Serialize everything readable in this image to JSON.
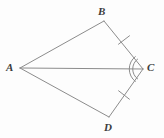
{
  "figure": {
    "name": "kite-quadrilateral-ABCD-with-diagonal-AC",
    "type": "geometry-diagram",
    "background_color": "#fdfdfd",
    "stroke_color": "#8c8c8c",
    "label_color": "#3c3c3c",
    "width": 164,
    "height": 138
  },
  "vertices": [
    {
      "id": "A",
      "label": "A",
      "x": 20,
      "y": 68
    },
    {
      "id": "B",
      "label": "B",
      "x": 104,
      "y": 21
    },
    {
      "id": "C",
      "label": "C",
      "x": 143,
      "y": 69
    },
    {
      "id": "D",
      "label": "D",
      "x": 109,
      "y": 117
    }
  ],
  "segments": [
    {
      "id": "AB",
      "from": "A",
      "to": "B",
      "x1": 20,
      "y1": 68,
      "x2": 104,
      "y2": 21
    },
    {
      "id": "BC",
      "from": "B",
      "to": "C",
      "x1": 104,
      "y1": 21,
      "x2": 143,
      "y2": 69
    },
    {
      "id": "CD",
      "from": "C",
      "to": "D",
      "x1": 143,
      "y1": 69,
      "x2": 109,
      "y2": 117
    },
    {
      "id": "DA",
      "from": "D",
      "to": "A",
      "x1": 109,
      "y1": 117,
      "x2": 20,
      "y2": 68
    },
    {
      "id": "AC",
      "from": "A",
      "to": "C",
      "x1": 20,
      "y1": 68,
      "x2": 143,
      "y2": 69,
      "role": "diagonal"
    }
  ],
  "tick_marks": [
    {
      "id": "tick-BC",
      "on_segment": "BC",
      "count": 1,
      "x": 124,
      "y": 40
    },
    {
      "id": "tick-CD",
      "on_segment": "CD",
      "count": 1,
      "x": 124,
      "y": 95
    }
  ],
  "angle_marks": [
    {
      "id": "angle-C",
      "at_vertex": "C",
      "arcs": 2,
      "description": "double arc marking angle BCD at vertex C"
    }
  ]
}
